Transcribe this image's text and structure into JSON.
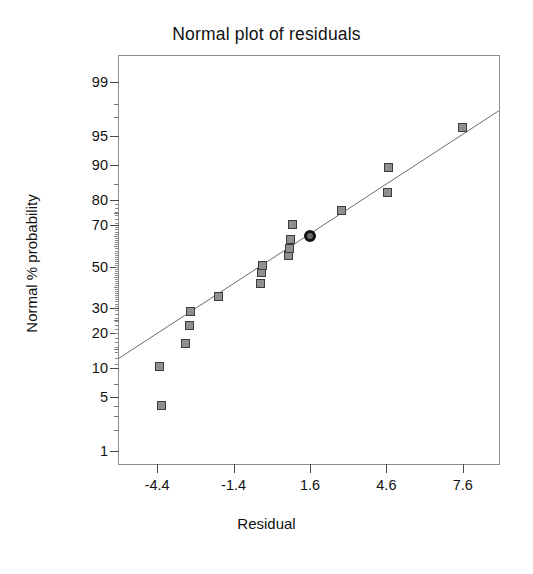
{
  "chart_data": {
    "type": "scatter",
    "title": "Normal plot of residuals",
    "xlabel": "Residual",
    "ylabel": "Normal % probability",
    "grid": false,
    "legend": "none",
    "xlim": [
      -5.9,
      9.1
    ],
    "xticks": [
      "-4.4",
      "-1.4",
      "1.6",
      "4.6",
      "7.6"
    ],
    "xtick_values": [
      -4.4,
      -1.4,
      1.6,
      4.6,
      7.6
    ],
    "yticks": [
      "1",
      "5",
      "10",
      "20",
      "30",
      "50",
      "70",
      "80",
      "90",
      "95",
      "99"
    ],
    "ytick_values": [
      1,
      5,
      10,
      20,
      30,
      50,
      70,
      80,
      90,
      95,
      99
    ],
    "y_scale": "normal probability (probit)",
    "ylim": [
      0.6,
      99.6
    ],
    "series": [
      {
        "name": "residuals",
        "marker": "square",
        "points": [
          {
            "x": -4.25,
            "y": 4.0
          },
          {
            "x": -4.3,
            "y": 10.5
          },
          {
            "x": -3.3,
            "y": 16.5
          },
          {
            "x": -3.15,
            "y": 23.0
          },
          {
            "x": -3.1,
            "y": 28.5
          },
          {
            "x": -2.0,
            "y": 35.5
          },
          {
            "x": -0.35,
            "y": 41.5
          },
          {
            "x": -0.3,
            "y": 47.0
          },
          {
            "x": -0.25,
            "y": 50.5
          },
          {
            "x": 0.75,
            "y": 55.5
          },
          {
            "x": 0.8,
            "y": 59.0
          },
          {
            "x": 0.85,
            "y": 63.5
          },
          {
            "x": 0.9,
            "y": 70.0
          },
          {
            "x": 2.85,
            "y": 76.0
          },
          {
            "x": 4.65,
            "y": 82.5
          },
          {
            "x": 4.7,
            "y": 89.5
          },
          {
            "x": 7.6,
            "y": 96.0
          }
        ]
      },
      {
        "name": "highlighted-point",
        "marker": "circle",
        "points": [
          {
            "x": 1.6,
            "y": 65.0
          }
        ]
      }
    ],
    "reference_line": {
      "style": "thin solid diagonal",
      "from": {
        "x": -5.9,
        "y": 12.0
      },
      "to": {
        "x": 9.1,
        "y": 97.5
      }
    }
  },
  "colors": {
    "marker_fill": "#8f8f8f",
    "marker_edge": "#3c3c3c",
    "highlight": "#111111",
    "axis": "#8d8d8d",
    "text": "#111111"
  }
}
